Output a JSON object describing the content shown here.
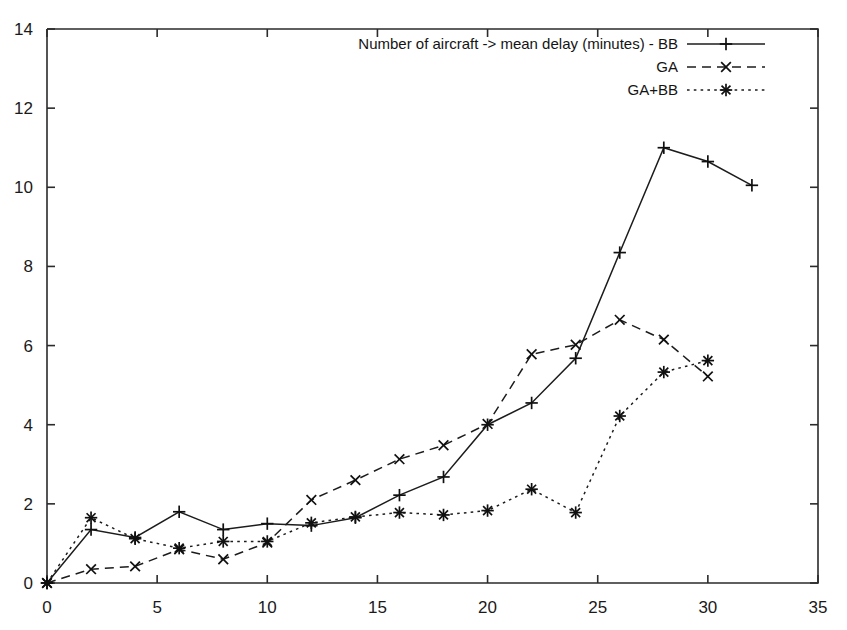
{
  "chart_data": {
    "type": "line",
    "title": "",
    "xlabel": "",
    "ylabel": "",
    "xlim": [
      0,
      35
    ],
    "ylim": [
      0,
      14
    ],
    "xticks": [
      0,
      5,
      10,
      15,
      20,
      25,
      30,
      35
    ],
    "yticks": [
      0,
      2,
      4,
      6,
      8,
      10,
      12,
      14
    ],
    "grid": false,
    "legend_position": "top-right",
    "legend_title": "Number of aircraft -> mean delay (minutes)",
    "series": [
      {
        "name": "BB",
        "legend_label": "Number of aircraft -> mean delay (minutes) - BB",
        "linestyle": "solid",
        "marker": "plus",
        "x": [
          0,
          2,
          4,
          6,
          8,
          10,
          12,
          14,
          16,
          18,
          20,
          22,
          24,
          26,
          28,
          30,
          32
        ],
        "y": [
          0,
          1.35,
          1.15,
          1.8,
          1.35,
          1.5,
          1.45,
          1.65,
          2.22,
          2.68,
          4.0,
          4.55,
          5.68,
          8.35,
          11.0,
          10.65,
          10.05
        ]
      },
      {
        "name": "GA",
        "legend_label": "GA",
        "linestyle": "dashed",
        "marker": "cross",
        "x": [
          0,
          2,
          4,
          6,
          8,
          10,
          12,
          14,
          16,
          18,
          20,
          22,
          24,
          26,
          28,
          30
        ],
        "y": [
          0,
          0.35,
          0.42,
          0.85,
          0.6,
          1.02,
          2.1,
          2.6,
          3.13,
          3.48,
          4.02,
          5.78,
          6.02,
          6.65,
          6.15,
          5.22
        ]
      },
      {
        "name": "GA+BB",
        "legend_label": "GA+BB",
        "linestyle": "dotted",
        "marker": "asterisk",
        "x": [
          0,
          2,
          4,
          6,
          8,
          10,
          12,
          14,
          16,
          18,
          20,
          22,
          24,
          26,
          28,
          30
        ],
        "y": [
          0,
          1.65,
          1.12,
          0.88,
          1.05,
          1.05,
          1.52,
          1.67,
          1.78,
          1.72,
          1.83,
          2.37,
          1.78,
          4.22,
          5.33,
          5.62
        ]
      }
    ]
  },
  "colors": {
    "ink": "#1c1c1c",
    "background": "#ffffff"
  }
}
